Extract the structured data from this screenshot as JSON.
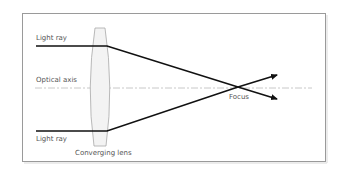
{
  "diagram": {
    "labels": {
      "top_ray": "Light ray",
      "bottom_ray": "Light ray",
      "optical_axis": "Optical axis",
      "lens": "Converging lens",
      "focus": "Focus"
    },
    "colors": {
      "frame": "#9a9a9a",
      "ray": "#111111",
      "axis": "#c8c8c8",
      "lens_fill": "#f3f3f3",
      "lens_stroke": "#a8a8a8",
      "label": "#555555"
    },
    "rays": [
      {
        "name": "top-ray",
        "start_side": "above-axis",
        "passes_through": "focus",
        "exits_side": "below-axis"
      },
      {
        "name": "bottom-ray",
        "start_side": "below-axis",
        "passes_through": "focus",
        "exits_side": "above-axis"
      }
    ]
  }
}
